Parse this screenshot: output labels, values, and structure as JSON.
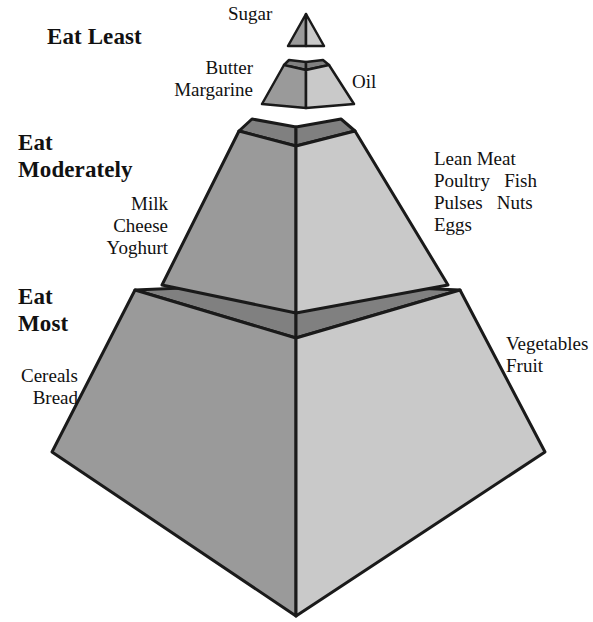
{
  "diagram": {
    "type": "food-guide-pyramid",
    "colors": {
      "face_left": "#9a9a9a",
      "face_right": "#c9c9c9",
      "face_top": "#808080",
      "outline": "#1a1a1a",
      "background": "#ffffff",
      "text": "#111111"
    }
  },
  "headings": {
    "eat_least": "Eat Least",
    "eat_moderately_line1": "Eat",
    "eat_moderately_line2": "Moderately",
    "eat_most_line1": "Eat",
    "eat_most_line2": "Most"
  },
  "labels": {
    "sugar": "Sugar",
    "butter_margarine": "Butter\nMargarine",
    "oil": "Oil",
    "dairy": "Milk\nCheese\nYoghurt",
    "protein": "Lean Meat\nPoultry   Fish\nPulses   Nuts\nEggs",
    "cereals_bread": "Cereals\nBread",
    "vegetables_fruit": "Vegetables\nFruit"
  },
  "tiers": [
    {
      "name": "apex",
      "heading": "Eat Least",
      "foods": [
        "Sugar"
      ],
      "shape": "triangle"
    },
    {
      "name": "fats",
      "heading": "Eat Least",
      "foods": [
        "Butter",
        "Margarine",
        "Oil"
      ],
      "shape": "frustum"
    },
    {
      "name": "moderate",
      "heading": "Eat Moderately",
      "foods": [
        "Milk",
        "Cheese",
        "Yoghurt",
        "Lean Meat",
        "Poultry",
        "Fish",
        "Pulses",
        "Nuts",
        "Eggs"
      ],
      "shape": "frustum"
    },
    {
      "name": "base",
      "heading": "Eat Most",
      "foods": [
        "Cereals",
        "Bread",
        "Vegetables",
        "Fruit"
      ],
      "shape": "frustum"
    }
  ]
}
